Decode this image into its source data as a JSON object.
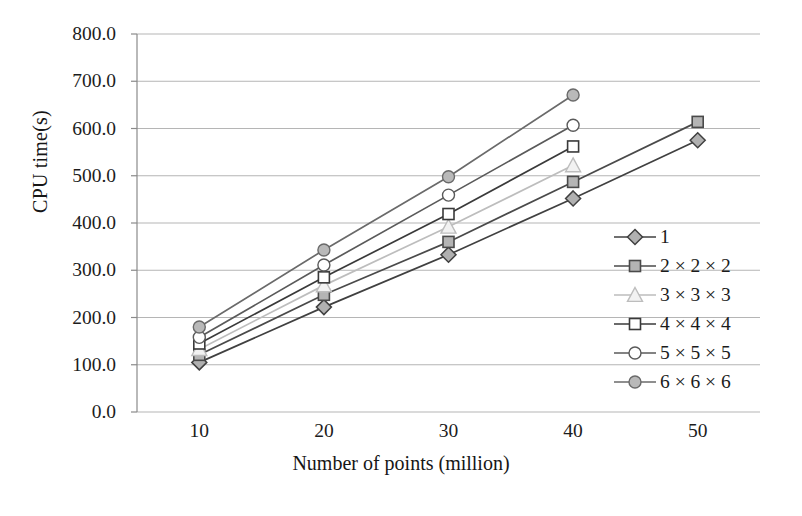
{
  "chart_data": {
    "type": "line",
    "title": "",
    "xlabel": "Number of points (million)",
    "ylabel": "CPU time(s)",
    "x": [
      10,
      20,
      30,
      40,
      50
    ],
    "xtick_labels": [
      "10",
      "20",
      "30",
      "40",
      "50"
    ],
    "ytick_labels": [
      "0.0",
      "100.0",
      "200.0",
      "300.0",
      "400.0",
      "500.0",
      "600.0",
      "700.0",
      "800.0"
    ],
    "ytick_values": [
      0,
      100,
      200,
      300,
      400,
      500,
      600,
      700,
      800
    ],
    "xlim": [
      5,
      55
    ],
    "ylim": [
      0,
      800
    ],
    "grid": "horizontal",
    "legend_position": "right-inside",
    "series": [
      {
        "name": "1",
        "marker": "diamond-filled-gray",
        "color": "#404040",
        "marker_fill": "#b0b0b0",
        "x": [
          10,
          20,
          30,
          40,
          50
        ],
        "values": [
          105,
          222,
          333,
          452,
          575
        ]
      },
      {
        "name": "2 × 2 × 2",
        "marker": "square-filled-gray",
        "color": "#4a4a4a",
        "marker_fill": "#b4b4b4",
        "x": [
          10,
          20,
          30,
          40,
          50
        ],
        "values": [
          121,
          248,
          360,
          487,
          614
        ]
      },
      {
        "name": "3 × 3 × 3",
        "marker": "triangle-open",
        "color": "#bdbdbd",
        "marker_fill": "#f2f2f2",
        "x": [
          10,
          20,
          30,
          40
        ],
        "values": [
          133,
          268,
          392,
          522
        ]
      },
      {
        "name": "4 × 4 × 4",
        "marker": "square-open",
        "color": "#3a3a3a",
        "marker_fill": "#ffffff",
        "x": [
          10,
          20,
          30,
          40
        ],
        "values": [
          145,
          285,
          419,
          562
        ]
      },
      {
        "name": "5 × 5 × 5",
        "marker": "circle-open",
        "color": "#5a5a5a",
        "marker_fill": "#ffffff",
        "x": [
          10,
          20,
          30,
          40
        ],
        "values": [
          158,
          311,
          459,
          607
        ]
      },
      {
        "name": "6 × 6 × 6",
        "marker": "circle-filled-gray",
        "color": "#6a6a6a",
        "marker_fill": "#b9b9b9",
        "x": [
          10,
          20,
          30,
          40
        ],
        "values": [
          180,
          343,
          498,
          671
        ]
      }
    ]
  },
  "axes": {
    "y_title": "CPU time(s)",
    "x_title": "Number of points (million)"
  },
  "legend": {
    "entries": [
      {
        "label": "1"
      },
      {
        "label": "2 × 2 × 2"
      },
      {
        "label": "3 × 3 × 3"
      },
      {
        "label": "4 × 4 × 4"
      },
      {
        "label": "5 × 5 × 5"
      },
      {
        "label": "6 × 6 × 6"
      }
    ]
  },
  "style": {
    "axis_color": "#8a8a8a",
    "grid_color": "#b5b5b5",
    "background": "#ffffff",
    "text_color": "#1b1b1b"
  }
}
